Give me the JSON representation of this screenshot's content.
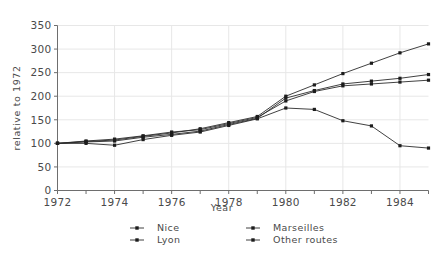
{
  "chart_data": {
    "type": "line",
    "title": "",
    "xlabel": "Year",
    "ylabel": "relative to 1972",
    "xlim": [
      1972,
      1985
    ],
    "ylim": [
      0,
      350
    ],
    "grid": true,
    "legend_position": "below-axis",
    "x": [
      1972,
      1973,
      1974,
      1975,
      1976,
      1977,
      1978,
      1979,
      1980,
      1981,
      1982,
      1983,
      1984,
      1985
    ],
    "xticks": [
      1972,
      1973,
      1974,
      1975,
      1976,
      1977,
      1978,
      1979,
      1980,
      1981,
      1982,
      1983,
      1984,
      1985
    ],
    "xticklabels": [
      "1972",
      "",
      "1974",
      "",
      "1976",
      "",
      "1978",
      "",
      "1980",
      "",
      "1982",
      "",
      "1984",
      ""
    ],
    "yticks": [
      0,
      50,
      100,
      150,
      200,
      250,
      300,
      350
    ],
    "yticklabels": [
      "0",
      "50",
      "100",
      "150",
      "200",
      "250",
      "300",
      "350"
    ],
    "series": [
      {
        "name": "Nice",
        "marker": "square",
        "values": [
          100,
          104,
          107,
          115,
          122,
          131,
          144,
          157,
          200,
          224,
          248,
          270,
          292,
          311
        ]
      },
      {
        "name": "Lyon",
        "marker": "square",
        "values": [
          100,
          103,
          105,
          113,
          119,
          126,
          140,
          153,
          196,
          212,
          226,
          232,
          238,
          246
        ]
      },
      {
        "name": "Marseilles",
        "marker": "square",
        "values": [
          100,
          105,
          109,
          116,
          124,
          129,
          142,
          155,
          190,
          210,
          222,
          226,
          230,
          234
        ]
      },
      {
        "name": "Other routes",
        "marker": "square",
        "values": [
          100,
          100,
          96,
          108,
          117,
          124,
          138,
          152,
          175,
          172,
          148,
          137,
          95,
          90
        ]
      }
    ]
  },
  "legend": {
    "entries": [
      {
        "label": "Nice",
        "column": 1
      },
      {
        "label": "Lyon",
        "column": 1
      },
      {
        "label": "Marseilles",
        "column": 2
      },
      {
        "label": "Other routes",
        "column": 2
      }
    ]
  },
  "axes": {
    "y_axis_title": "relative to 1972",
    "x_axis_title": "Year"
  }
}
